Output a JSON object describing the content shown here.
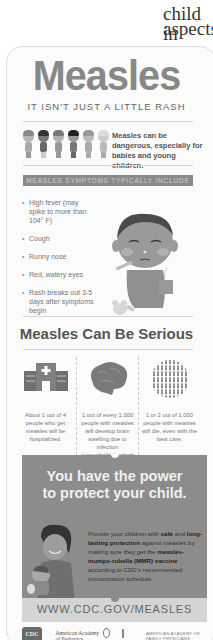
{
  "page_fragment": {
    "line1": "child in",
    "line2": "aspects"
  },
  "infographic": {
    "title": "Measles",
    "subtitle": "IT ISN'T JUST A LITTLE RASH",
    "danger_text": "Measles can be dangerous, especially for babies and young children.",
    "symptoms_banner": "MEASLES SYMPTOMS TYPICALLY INCLUDE",
    "symptoms": [
      "High fever (may spike to more than 104° F)",
      "Cough",
      "Runny nose",
      "Red, watery eyes",
      "Rash breaks out 3-5 days after symptoms begin"
    ],
    "serious_heading": "Measles Can Be Serious",
    "stats": [
      {
        "icon": "hospital-icon",
        "text": "About 1 out of 4 people who get measles will be hospitalized."
      },
      {
        "icon": "brain-icon",
        "text": "1 out of every 1,000 people with measles will develop brain swelling due to infection (encephalitis), which may lead to brain damage."
      },
      {
        "icon": "people-globe-icon",
        "text": "1 or 2 out of 1,000 people with measles will die, even with the best care."
      }
    ],
    "power_headline_1": "You have the power",
    "power_headline_2": "to protect your child.",
    "power_body": {
      "p1": "Provide your children with ",
      "b1": "safe",
      "p2": " and ",
      "b2": "long-lasting protection",
      "p3": " against measles by making sure they get the ",
      "b3": "measles-mumps-rubella (MMR) vaccine",
      "p4": " according to CDC's recommended immunization schedule."
    },
    "url": "WWW.CDC.GOV/MEASLES",
    "logos": {
      "cdc": "CDC",
      "aap": "American Academy of Pediatrics",
      "aafp": "AMERICAN ACADEMY OF FAMILY PHYSICIANS"
    }
  },
  "colors": {
    "title": "#888888",
    "banner_bg": "#8a8a8a",
    "power_bg": "#8c8c8c",
    "url_bg": "#d4d4d4"
  }
}
